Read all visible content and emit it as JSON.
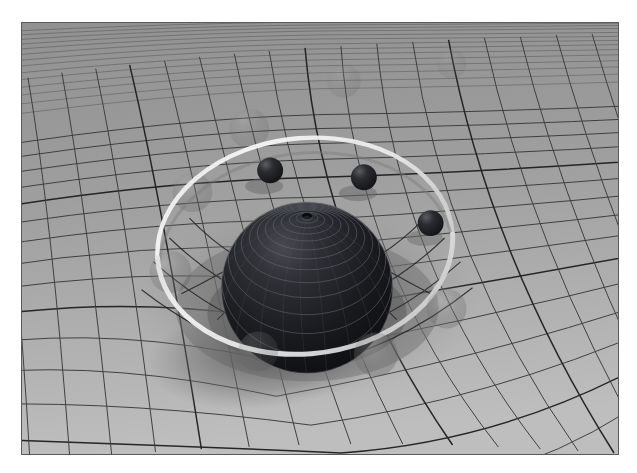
{
  "figure": {
    "title": "Spacetime curvature grid with massive central sphere and orbiting bodies",
    "kind": "3d-render",
    "palette": {
      "page_background": "#ffffff",
      "plane_base": "#a2a2a2",
      "plane_far": "#9a9a9a",
      "plane_near": "#bdbdbd",
      "grid_line": "#3c3c3c",
      "grid_line_major": "#1e1e1e",
      "well_shade": "#7a7a7a",
      "sphere_dark": "#15161a",
      "sphere_mid": "#2c2e33",
      "sphere_rim": "#6a6c72",
      "sphere_wire": "#4e5056",
      "satellite_dark": "#191a1d",
      "satellite_hi": "#5c5e64",
      "orbit_ring": "#f2f2f2",
      "orbit_ring_shadow": "#8a8a8a",
      "ghost_sphere": "#6f6f6f",
      "shadow": "#6b6b6b",
      "frame_border": "#5a5a5a"
    },
    "frame": {
      "x": 21,
      "y": 22,
      "width": 598,
      "height": 433
    },
    "plane": {
      "description": "receding perspective grid representing the spacetime fabric",
      "grid_columns": 34,
      "grid_rows": 26,
      "major_line_every": 5,
      "vanishing_direction": "upper-left"
    },
    "central_body": {
      "name": "massive-sphere",
      "center_x": 307,
      "center_y": 288,
      "radius": 86,
      "surface": "concentric latitude rings with fine longitude wireframe",
      "pole_x": 307,
      "pole_y": 217,
      "ring_count": 14
    },
    "gravity_well": {
      "center_x": 307,
      "center_y": 300,
      "radius_x": 168,
      "radius_y": 96,
      "depth": 58
    },
    "orbit_ring": {
      "name": "orbital-path",
      "center_x": 305,
      "center_y": 258,
      "radius_x": 148,
      "radius_y": 108,
      "tilt_degrees": -6,
      "stroke_width": 4
    },
    "satellites": [
      {
        "id": "satellite-1",
        "cx": 270,
        "cy": 170,
        "r": 13
      },
      {
        "id": "satellite-2",
        "cx": 364,
        "cy": 177,
        "r": 13
      },
      {
        "id": "satellite-3",
        "cx": 431,
        "cy": 223,
        "r": 13
      }
    ],
    "ghost_bodies": [
      {
        "id": "ghost-1",
        "cx": 344,
        "cy": 80,
        "r": 17,
        "opacity": 0.16
      },
      {
        "id": "ghost-2",
        "cx": 452,
        "cy": 63,
        "r": 15,
        "opacity": 0.14
      },
      {
        "id": "ghost-3",
        "cx": 249,
        "cy": 128,
        "r": 20,
        "opacity": 0.22
      },
      {
        "id": "ghost-4",
        "cx": 192,
        "cy": 192,
        "r": 20,
        "opacity": 0.26
      },
      {
        "id": "ghost-5",
        "cx": 170,
        "cy": 272,
        "r": 21,
        "opacity": 0.28
      },
      {
        "id": "ghost-6",
        "cx": 376,
        "cy": 355,
        "r": 22,
        "opacity": 0.3
      },
      {
        "id": "ghost-7",
        "cx": 447,
        "cy": 309,
        "r": 20,
        "opacity": 0.26
      },
      {
        "id": "ghost-8",
        "cx": 258,
        "cy": 352,
        "r": 20,
        "opacity": 0.24
      }
    ]
  }
}
